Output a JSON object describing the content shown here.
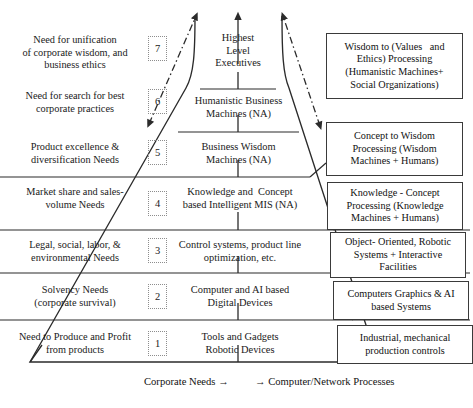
{
  "diagram": {
    "levels": [
      {
        "number": "7",
        "need": "Need for unification\nof corporate wisdom, and\nbusiness ethics",
        "band": "Highest\nLevel\nExecutives",
        "process": "Wisdom to (Values   and\nEthics) Processing\n(Humanistic Machines+\nSocial Organizations)"
      },
      {
        "number": "6",
        "need": "Need for search for best\ncorporate practices",
        "band": "Humanistic Business\nMachines (NA)",
        "process": ""
      },
      {
        "number": "5",
        "need": "Product excellence &\ndiversification Needs",
        "band": "Business Wisdom\nMachines (NA)",
        "process": "Concept to Wisdom\nProcessing (Wisdom\nMachines + Humans)"
      },
      {
        "number": "4",
        "need": "Market share and sales-\nvolume Needs",
        "band": "Knowledge and  Concept\nbased Intelligent MIS (NA)",
        "process": "Knowledge - Concept\nProcessing (Knowledge\nMachines + Humans)"
      },
      {
        "number": "3",
        "need": "Legal, social, labor, &\nenvironmental Needs",
        "band": "Control systems, product line\noptimization, etc.",
        "process": "Object- Oriented, Robotic\nSystems + Interactive\nFacilities"
      },
      {
        "number": "2",
        "need": "Solvency Needs\n(corporate survival)",
        "band": "Computer and AI based\nDigital Devices",
        "process": "Computers Graphics & AI\nbased Systems"
      },
      {
        "number": "1",
        "need": "Need to Produce and Profit\nfrom products",
        "band": "Tools and Gadgets\nRobotic Devices",
        "process": "Industrial, mechanical\nproduction controls"
      }
    ],
    "footer": {
      "left_caption": "Corporate Needs →",
      "right_caption": "→  Computer/Network Processes"
    },
    "colors": {
      "line": "#2b2b2b",
      "chip_border": "#8d8d8d",
      "box_border": "#3a3a3a",
      "text": "#1a1a1a",
      "background": "#ffffff"
    }
  }
}
